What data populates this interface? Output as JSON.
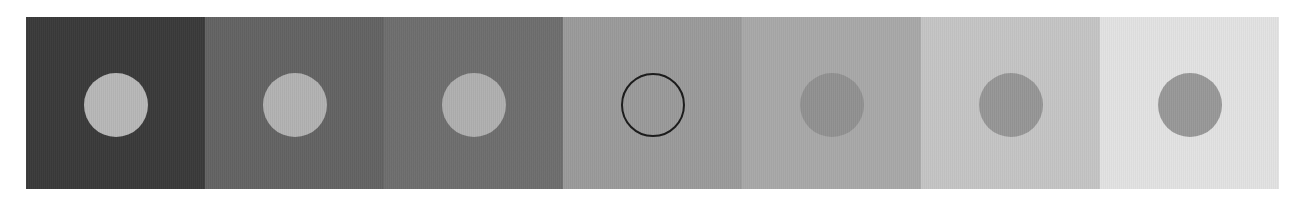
{
  "figure": {
    "name": "simultaneous-lightness-contrast-strip",
    "background_color": "#ffffff",
    "strip": {
      "x": 26,
      "y": 17,
      "width": 1253,
      "height": 172,
      "panel_count": 7,
      "panel_width": 179,
      "disc_diameter": 64
    }
  },
  "chart_data": {
    "type": "heatmap",
    "title": "",
    "subtitle": "",
    "xlabel": "",
    "ylabel": "",
    "grid": false,
    "legend": "none",
    "categories": [
      "1",
      "2",
      "3",
      "4",
      "5",
      "6",
      "7"
    ],
    "series": [
      {
        "name": "background_luminance",
        "values": [
          58,
          99,
          110,
          154,
          168,
          196,
          226
        ]
      },
      {
        "name": "disc_luminance",
        "values": [
          183,
          178,
          175,
          154,
          145,
          150,
          152
        ]
      }
    ],
    "ylim": [
      0,
      255
    ]
  },
  "panels": [
    {
      "label": "panel-1",
      "background": "#3a3a3a",
      "disc_color": "#b7b7b7",
      "disc_style": "filled",
      "disc_outline": false
    },
    {
      "label": "panel-2",
      "background": "#636363",
      "disc_color": "#b2b2b2",
      "disc_style": "filled",
      "disc_outline": false
    },
    {
      "label": "panel-3",
      "background": "#6e6e6e",
      "disc_color": "#afafaf",
      "disc_style": "filled",
      "disc_outline": false
    },
    {
      "label": "panel-4",
      "background": "#9a9a9a",
      "disc_color": "#9a9a9a",
      "disc_style": "outlined",
      "disc_outline": true,
      "outline_color": "#1c1c1c"
    },
    {
      "label": "panel-5",
      "background": "#a8a8a8",
      "disc_color": "#919191",
      "disc_style": "filled",
      "disc_outline": false
    },
    {
      "label": "panel-6",
      "background": "#c4c4c4",
      "disc_color": "#969696",
      "disc_style": "filled",
      "disc_outline": false
    },
    {
      "label": "panel-7",
      "background": "#e2e2e2",
      "disc_color": "#989898",
      "disc_style": "filled",
      "disc_outline": false
    }
  ]
}
